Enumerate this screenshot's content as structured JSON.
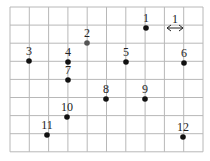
{
  "figure": {
    "grid": {
      "columns": 10,
      "rows": 8,
      "left": 10,
      "top": 7,
      "cell_w": 19.3,
      "cell_h": 18.1,
      "line_color": "#b8b8b8"
    },
    "scale_marker": {
      "label": "1",
      "x1": 166,
      "x2": 184,
      "y": 28
    },
    "points": [
      {
        "label": "1",
        "x": 146,
        "y": 28,
        "color": "#111111"
      },
      {
        "label": "2",
        "x": 87,
        "y": 43,
        "color": "#555555"
      },
      {
        "label": "3",
        "x": 29,
        "y": 61,
        "color": "#111111"
      },
      {
        "label": "4",
        "x": 68,
        "y": 62,
        "color": "#111111"
      },
      {
        "label": "5",
        "x": 126,
        "y": 62,
        "color": "#111111"
      },
      {
        "label": "6",
        "x": 184,
        "y": 63,
        "color": "#111111"
      },
      {
        "label": "7",
        "x": 68,
        "y": 80,
        "color": "#111111"
      },
      {
        "label": "8",
        "x": 106,
        "y": 99,
        "color": "#111111"
      },
      {
        "label": "9",
        "x": 145,
        "y": 99,
        "color": "#111111"
      },
      {
        "label": "10",
        "x": 67,
        "y": 117,
        "color": "#111111"
      },
      {
        "label": "11",
        "x": 47,
        "y": 135,
        "color": "#111111"
      },
      {
        "label": "12",
        "x": 183,
        "y": 137,
        "color": "#111111"
      }
    ]
  }
}
